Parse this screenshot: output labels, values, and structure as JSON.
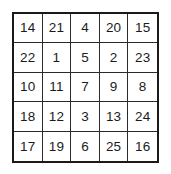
{
  "grid": {
    "title": "5x5 number grid",
    "rows": 5,
    "columns": 5,
    "border_color": "#1a1a1a",
    "line_color": "#2b2b2b",
    "text_color": "#1b1b1b",
    "background_color": "#ffffff",
    "cells": [
      [
        "14",
        "21",
        "4",
        "20",
        "15"
      ],
      [
        "22",
        "1",
        "5",
        "2",
        "23"
      ],
      [
        "10",
        "11",
        "7",
        "9",
        "8"
      ],
      [
        "18",
        "12",
        "3",
        "13",
        "24"
      ],
      [
        "17",
        "19",
        "6",
        "25",
        "16"
      ]
    ]
  }
}
